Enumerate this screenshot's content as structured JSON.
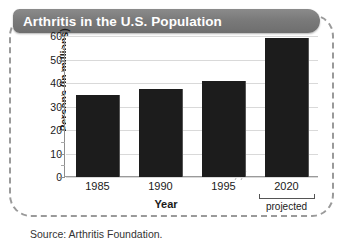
{
  "figure": {
    "title": "Arthritis in the U.S. Population",
    "source": "Source: Arthritis Foundation.",
    "projected_note": "projected",
    "frame_style": "dashed-rounded",
    "title_bar_color": "#7a7a7a",
    "title_text_color": "#ffffff",
    "bar_color": "#1c1c1c",
    "gridline_color": "#d9d9d9"
  },
  "chart_data": {
    "type": "bar",
    "title": "Arthritis in the U.S. Population",
    "xlabel": "Year",
    "ylabel": "Persons (in millions)",
    "categories": [
      "1985",
      "1990",
      "1995",
      "2020"
    ],
    "values": [
      35,
      37.5,
      41,
      59
    ],
    "ylim": [
      0,
      60
    ],
    "yticks": [
      0,
      10,
      20,
      30,
      40,
      50,
      60
    ],
    "ytick_labels": [
      "0",
      "10",
      "20",
      "30",
      "40",
      "50",
      "60"
    ],
    "minor_yticks": [
      5,
      15,
      25,
      35,
      45,
      55
    ],
    "grid": true,
    "legend": null,
    "annotations": [
      {
        "text": "projected",
        "applies_to": "2020"
      },
      {
        "text": "axis-break",
        "between": [
          "1995",
          "2020"
        ]
      }
    ],
    "bar_color": "#1c1c1c",
    "source": "Source: Arthritis Foundation."
  }
}
